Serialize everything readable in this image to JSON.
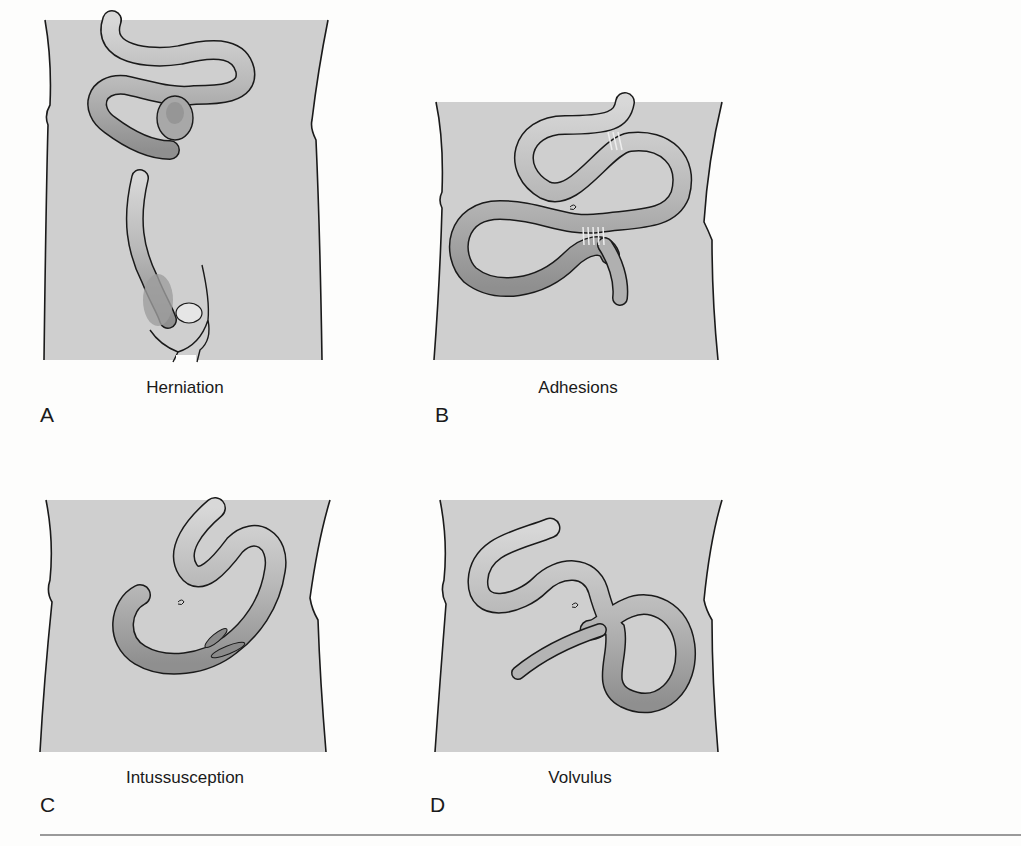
{
  "figure": {
    "panels": [
      {
        "letter": "A",
        "caption": "Herniation",
        "illustration": "hernia-illustration"
      },
      {
        "letter": "B",
        "caption": "Adhesions",
        "illustration": "adhesions-illustration"
      },
      {
        "letter": "C",
        "caption": "Intussusception",
        "illustration": "intussusception-illustration"
      },
      {
        "letter": "D",
        "caption": "Volvulus",
        "illustration": "volvulus-illustration"
      }
    ],
    "colors": {
      "torso_fill": "#cfcfcf",
      "outline": "#1a1a1a",
      "bowel_fill": "#bdbdbd",
      "bowel_shadow": "#8e8e8e",
      "rule": "#9a9a9a"
    }
  }
}
